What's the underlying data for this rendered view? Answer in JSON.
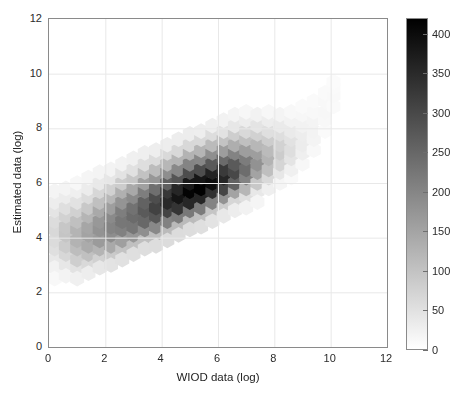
{
  "chart_data": {
    "type": "heatmap",
    "subtype": "hexbin",
    "title": "",
    "xlabel": "WIOD data (log)",
    "ylabel": "Estimated data (log)",
    "xlim": [
      0,
      12
    ],
    "ylim": [
      0,
      12
    ],
    "xticks": [
      0,
      2,
      4,
      6,
      8,
      10,
      12
    ],
    "yticks": [
      0,
      2,
      4,
      6,
      8,
      10,
      12
    ],
    "xtick_labels": [
      "0",
      "2",
      "4",
      "6",
      "8",
      "10",
      "12"
    ],
    "ytick_labels": [
      "0",
      "2",
      "4",
      "6",
      "8",
      "10",
      "12"
    ],
    "grid": true,
    "colormap": "grayscale-inverted",
    "colorbar": {
      "position": "right",
      "vmin": 0,
      "vmax": 420,
      "ticks": [
        0,
        50,
        100,
        150,
        200,
        250,
        300,
        350,
        400
      ],
      "tick_labels": [
        "0",
        "50",
        "100",
        "150",
        "200",
        "250",
        "300",
        "350",
        "400"
      ]
    },
    "hex_grid": {
      "radius_data_units": 0.2356,
      "dx_data_units": 0.408,
      "dy_data_units": 0.3534,
      "note": "Hexagonal bins tiled across the x-y plane; counts mapped to grayscale via colorbar."
    },
    "bins": [
      {
        "x": 0.2,
        "y": 3.2,
        "c": 38
      },
      {
        "x": 0.2,
        "y": 3.6,
        "c": 52
      },
      {
        "x": 0.2,
        "y": 3.9,
        "c": 60
      },
      {
        "x": 0.2,
        "y": 4.3,
        "c": 64
      },
      {
        "x": 0.2,
        "y": 4.6,
        "c": 58
      },
      {
        "x": 0.2,
        "y": 5.0,
        "c": 44
      },
      {
        "x": 0.2,
        "y": 5.3,
        "c": 30
      },
      {
        "x": 0.2,
        "y": 5.7,
        "c": 18
      },
      {
        "x": 0.2,
        "y": 2.9,
        "c": 22
      },
      {
        "x": 0.2,
        "y": 2.5,
        "c": 12
      },
      {
        "x": 0.6,
        "y": 3.0,
        "c": 40
      },
      {
        "x": 0.6,
        "y": 3.4,
        "c": 66
      },
      {
        "x": 0.6,
        "y": 3.7,
        "c": 84
      },
      {
        "x": 0.6,
        "y": 4.1,
        "c": 96
      },
      {
        "x": 0.6,
        "y": 4.4,
        "c": 92
      },
      {
        "x": 0.6,
        "y": 4.8,
        "c": 74
      },
      {
        "x": 0.6,
        "y": 5.1,
        "c": 52
      },
      {
        "x": 0.6,
        "y": 5.5,
        "c": 32
      },
      {
        "x": 0.6,
        "y": 5.8,
        "c": 18
      },
      {
        "x": 0.6,
        "y": 2.6,
        "c": 20
      },
      {
        "x": 1.0,
        "y": 2.9,
        "c": 48
      },
      {
        "x": 1.0,
        "y": 3.2,
        "c": 80
      },
      {
        "x": 1.0,
        "y": 3.6,
        "c": 108
      },
      {
        "x": 1.0,
        "y": 3.9,
        "c": 126
      },
      {
        "x": 1.0,
        "y": 4.3,
        "c": 124
      },
      {
        "x": 1.0,
        "y": 4.6,
        "c": 104
      },
      {
        "x": 1.0,
        "y": 5.0,
        "c": 76
      },
      {
        "x": 1.0,
        "y": 5.3,
        "c": 48
      },
      {
        "x": 1.0,
        "y": 5.7,
        "c": 26
      },
      {
        "x": 1.0,
        "y": 6.0,
        "c": 14
      },
      {
        "x": 1.0,
        "y": 2.5,
        "c": 24
      },
      {
        "x": 1.4,
        "y": 3.0,
        "c": 62
      },
      {
        "x": 1.4,
        "y": 3.4,
        "c": 104
      },
      {
        "x": 1.4,
        "y": 3.7,
        "c": 138
      },
      {
        "x": 1.4,
        "y": 4.1,
        "c": 152
      },
      {
        "x": 1.4,
        "y": 4.4,
        "c": 146
      },
      {
        "x": 1.4,
        "y": 4.8,
        "c": 122
      },
      {
        "x": 1.4,
        "y": 5.1,
        "c": 90
      },
      {
        "x": 1.4,
        "y": 5.5,
        "c": 58
      },
      {
        "x": 1.4,
        "y": 5.8,
        "c": 32
      },
      {
        "x": 1.4,
        "y": 6.2,
        "c": 16
      },
      {
        "x": 1.4,
        "y": 2.7,
        "c": 30
      },
      {
        "x": 1.8,
        "y": 3.2,
        "c": 76
      },
      {
        "x": 1.8,
        "y": 3.6,
        "c": 124
      },
      {
        "x": 1.8,
        "y": 3.9,
        "c": 164
      },
      {
        "x": 1.8,
        "y": 4.3,
        "c": 178
      },
      {
        "x": 1.8,
        "y": 4.6,
        "c": 170
      },
      {
        "x": 1.8,
        "y": 5.0,
        "c": 142
      },
      {
        "x": 1.8,
        "y": 5.3,
        "c": 104
      },
      {
        "x": 1.8,
        "y": 5.7,
        "c": 66
      },
      {
        "x": 1.8,
        "y": 6.0,
        "c": 36
      },
      {
        "x": 1.8,
        "y": 6.4,
        "c": 18
      },
      {
        "x": 1.8,
        "y": 2.9,
        "c": 40
      },
      {
        "x": 2.2,
        "y": 3.4,
        "c": 88
      },
      {
        "x": 2.2,
        "y": 3.7,
        "c": 142
      },
      {
        "x": 2.2,
        "y": 4.1,
        "c": 188
      },
      {
        "x": 2.2,
        "y": 4.4,
        "c": 202
      },
      {
        "x": 2.2,
        "y": 4.8,
        "c": 192
      },
      {
        "x": 2.2,
        "y": 5.1,
        "c": 160
      },
      {
        "x": 2.2,
        "y": 5.5,
        "c": 118
      },
      {
        "x": 2.2,
        "y": 5.8,
        "c": 76
      },
      {
        "x": 2.2,
        "y": 6.2,
        "c": 42
      },
      {
        "x": 2.2,
        "y": 6.5,
        "c": 20
      },
      {
        "x": 2.2,
        "y": 3.0,
        "c": 46
      },
      {
        "x": 2.6,
        "y": 3.6,
        "c": 98
      },
      {
        "x": 2.6,
        "y": 3.9,
        "c": 158
      },
      {
        "x": 2.6,
        "y": 4.3,
        "c": 208
      },
      {
        "x": 2.6,
        "y": 4.6,
        "c": 224
      },
      {
        "x": 2.6,
        "y": 5.0,
        "c": 212
      },
      {
        "x": 2.6,
        "y": 5.3,
        "c": 176
      },
      {
        "x": 2.6,
        "y": 5.7,
        "c": 130
      },
      {
        "x": 2.6,
        "y": 6.0,
        "c": 84
      },
      {
        "x": 2.6,
        "y": 6.4,
        "c": 46
      },
      {
        "x": 2.6,
        "y": 6.7,
        "c": 22
      },
      {
        "x": 2.6,
        "y": 3.2,
        "c": 50
      },
      {
        "x": 3.0,
        "y": 3.7,
        "c": 104
      },
      {
        "x": 3.0,
        "y": 4.1,
        "c": 172
      },
      {
        "x": 3.0,
        "y": 4.4,
        "c": 226
      },
      {
        "x": 3.0,
        "y": 4.8,
        "c": 244
      },
      {
        "x": 3.0,
        "y": 5.1,
        "c": 232
      },
      {
        "x": 3.0,
        "y": 5.5,
        "c": 192
      },
      {
        "x": 3.0,
        "y": 5.8,
        "c": 142
      },
      {
        "x": 3.0,
        "y": 6.2,
        "c": 92
      },
      {
        "x": 3.0,
        "y": 6.5,
        "c": 50
      },
      {
        "x": 3.0,
        "y": 6.9,
        "c": 24
      },
      {
        "x": 3.0,
        "y": 3.4,
        "c": 52
      },
      {
        "x": 3.4,
        "y": 3.9,
        "c": 106
      },
      {
        "x": 3.4,
        "y": 4.3,
        "c": 184
      },
      {
        "x": 3.4,
        "y": 4.6,
        "c": 248
      },
      {
        "x": 3.4,
        "y": 5.0,
        "c": 272
      },
      {
        "x": 3.4,
        "y": 5.3,
        "c": 258
      },
      {
        "x": 3.4,
        "y": 5.7,
        "c": 212
      },
      {
        "x": 3.4,
        "y": 6.0,
        "c": 156
      },
      {
        "x": 3.4,
        "y": 6.4,
        "c": 100
      },
      {
        "x": 3.4,
        "y": 6.7,
        "c": 54
      },
      {
        "x": 3.4,
        "y": 7.1,
        "c": 26
      },
      {
        "x": 3.4,
        "y": 3.6,
        "c": 54
      },
      {
        "x": 3.8,
        "y": 4.1,
        "c": 108
      },
      {
        "x": 3.8,
        "y": 4.4,
        "c": 196
      },
      {
        "x": 3.8,
        "y": 4.8,
        "c": 278
      },
      {
        "x": 3.8,
        "y": 5.1,
        "c": 312
      },
      {
        "x": 3.8,
        "y": 5.5,
        "c": 294
      },
      {
        "x": 3.8,
        "y": 5.8,
        "c": 238
      },
      {
        "x": 3.8,
        "y": 6.2,
        "c": 172
      },
      {
        "x": 3.8,
        "y": 6.5,
        "c": 110
      },
      {
        "x": 3.8,
        "y": 6.9,
        "c": 58
      },
      {
        "x": 3.8,
        "y": 7.2,
        "c": 28
      },
      {
        "x": 3.8,
        "y": 3.7,
        "c": 56
      },
      {
        "x": 4.2,
        "y": 4.3,
        "c": 112
      },
      {
        "x": 4.2,
        "y": 4.6,
        "c": 206
      },
      {
        "x": 4.2,
        "y": 5.0,
        "c": 308
      },
      {
        "x": 4.2,
        "y": 5.3,
        "c": 352
      },
      {
        "x": 4.2,
        "y": 5.7,
        "c": 330
      },
      {
        "x": 4.2,
        "y": 6.0,
        "c": 262
      },
      {
        "x": 4.2,
        "y": 6.4,
        "c": 186
      },
      {
        "x": 4.2,
        "y": 6.7,
        "c": 118
      },
      {
        "x": 4.2,
        "y": 7.1,
        "c": 62
      },
      {
        "x": 4.2,
        "y": 7.4,
        "c": 30
      },
      {
        "x": 4.2,
        "y": 3.9,
        "c": 58
      },
      {
        "x": 4.6,
        "y": 4.4,
        "c": 114
      },
      {
        "x": 4.6,
        "y": 4.8,
        "c": 216
      },
      {
        "x": 4.6,
        "y": 5.1,
        "c": 334
      },
      {
        "x": 4.6,
        "y": 5.5,
        "c": 386
      },
      {
        "x": 4.6,
        "y": 5.8,
        "c": 358
      },
      {
        "x": 4.6,
        "y": 6.2,
        "c": 280
      },
      {
        "x": 4.6,
        "y": 6.5,
        "c": 196
      },
      {
        "x": 4.6,
        "y": 6.9,
        "c": 124
      },
      {
        "x": 4.6,
        "y": 7.2,
        "c": 64
      },
      {
        "x": 4.6,
        "y": 7.6,
        "c": 30
      },
      {
        "x": 4.6,
        "y": 4.1,
        "c": 58
      },
      {
        "x": 5.0,
        "y": 4.6,
        "c": 112
      },
      {
        "x": 5.0,
        "y": 5.0,
        "c": 222
      },
      {
        "x": 5.0,
        "y": 5.3,
        "c": 356
      },
      {
        "x": 5.0,
        "y": 5.7,
        "c": 414
      },
      {
        "x": 5.0,
        "y": 6.0,
        "c": 380
      },
      {
        "x": 5.0,
        "y": 6.4,
        "c": 294
      },
      {
        "x": 5.0,
        "y": 6.7,
        "c": 202
      },
      {
        "x": 5.0,
        "y": 7.1,
        "c": 126
      },
      {
        "x": 5.0,
        "y": 7.4,
        "c": 64
      },
      {
        "x": 5.0,
        "y": 7.8,
        "c": 30
      },
      {
        "x": 5.0,
        "y": 4.3,
        "c": 56
      },
      {
        "x": 5.4,
        "y": 4.8,
        "c": 106
      },
      {
        "x": 5.4,
        "y": 5.1,
        "c": 218
      },
      {
        "x": 5.4,
        "y": 5.5,
        "c": 358
      },
      {
        "x": 5.4,
        "y": 5.8,
        "c": 418
      },
      {
        "x": 5.4,
        "y": 6.2,
        "c": 382
      },
      {
        "x": 5.4,
        "y": 6.5,
        "c": 292
      },
      {
        "x": 5.4,
        "y": 6.9,
        "c": 198
      },
      {
        "x": 5.4,
        "y": 7.2,
        "c": 122
      },
      {
        "x": 5.4,
        "y": 7.6,
        "c": 62
      },
      {
        "x": 5.4,
        "y": 7.9,
        "c": 28
      },
      {
        "x": 5.4,
        "y": 4.4,
        "c": 52
      },
      {
        "x": 5.8,
        "y": 5.0,
        "c": 96
      },
      {
        "x": 5.8,
        "y": 5.3,
        "c": 204
      },
      {
        "x": 5.8,
        "y": 5.7,
        "c": 340
      },
      {
        "x": 5.8,
        "y": 6.0,
        "c": 398
      },
      {
        "x": 5.8,
        "y": 6.4,
        "c": 362
      },
      {
        "x": 5.8,
        "y": 6.7,
        "c": 274
      },
      {
        "x": 5.8,
        "y": 7.1,
        "c": 184
      },
      {
        "x": 5.8,
        "y": 7.4,
        "c": 112
      },
      {
        "x": 5.8,
        "y": 7.8,
        "c": 56
      },
      {
        "x": 5.8,
        "y": 8.1,
        "c": 26
      },
      {
        "x": 5.8,
        "y": 4.6,
        "c": 46
      },
      {
        "x": 6.2,
        "y": 5.1,
        "c": 84
      },
      {
        "x": 6.2,
        "y": 5.5,
        "c": 180
      },
      {
        "x": 6.2,
        "y": 5.8,
        "c": 306
      },
      {
        "x": 6.2,
        "y": 6.2,
        "c": 358
      },
      {
        "x": 6.2,
        "y": 6.5,
        "c": 324
      },
      {
        "x": 6.2,
        "y": 6.9,
        "c": 244
      },
      {
        "x": 6.2,
        "y": 7.2,
        "c": 162
      },
      {
        "x": 6.2,
        "y": 7.6,
        "c": 98
      },
      {
        "x": 6.2,
        "y": 7.9,
        "c": 48
      },
      {
        "x": 6.2,
        "y": 8.3,
        "c": 22
      },
      {
        "x": 6.2,
        "y": 4.8,
        "c": 38
      },
      {
        "x": 6.6,
        "y": 5.3,
        "c": 68
      },
      {
        "x": 6.6,
        "y": 5.7,
        "c": 152
      },
      {
        "x": 6.6,
        "y": 6.0,
        "c": 258
      },
      {
        "x": 6.6,
        "y": 6.4,
        "c": 302
      },
      {
        "x": 6.6,
        "y": 6.7,
        "c": 272
      },
      {
        "x": 6.6,
        "y": 7.1,
        "c": 204
      },
      {
        "x": 6.6,
        "y": 7.4,
        "c": 134
      },
      {
        "x": 6.6,
        "y": 7.8,
        "c": 80
      },
      {
        "x": 6.6,
        "y": 8.1,
        "c": 40
      },
      {
        "x": 6.6,
        "y": 8.5,
        "c": 18
      },
      {
        "x": 6.6,
        "y": 5.0,
        "c": 30
      },
      {
        "x": 7.0,
        "y": 5.5,
        "c": 52
      },
      {
        "x": 7.0,
        "y": 5.8,
        "c": 120
      },
      {
        "x": 7.0,
        "y": 6.2,
        "c": 204
      },
      {
        "x": 7.0,
        "y": 6.5,
        "c": 240
      },
      {
        "x": 7.0,
        "y": 6.9,
        "c": 216
      },
      {
        "x": 7.0,
        "y": 7.2,
        "c": 160
      },
      {
        "x": 7.0,
        "y": 7.6,
        "c": 104
      },
      {
        "x": 7.0,
        "y": 7.9,
        "c": 62
      },
      {
        "x": 7.0,
        "y": 8.3,
        "c": 30
      },
      {
        "x": 7.0,
        "y": 8.6,
        "c": 14
      },
      {
        "x": 7.0,
        "y": 5.1,
        "c": 22
      },
      {
        "x": 7.4,
        "y": 5.7,
        "c": 38
      },
      {
        "x": 7.4,
        "y": 6.0,
        "c": 90
      },
      {
        "x": 7.4,
        "y": 6.4,
        "c": 152
      },
      {
        "x": 7.4,
        "y": 6.7,
        "c": 180
      },
      {
        "x": 7.4,
        "y": 7.1,
        "c": 160
      },
      {
        "x": 7.4,
        "y": 7.4,
        "c": 118
      },
      {
        "x": 7.4,
        "y": 7.8,
        "c": 76
      },
      {
        "x": 7.4,
        "y": 8.1,
        "c": 44
      },
      {
        "x": 7.4,
        "y": 8.5,
        "c": 22
      },
      {
        "x": 7.4,
        "y": 5.3,
        "c": 16
      },
      {
        "x": 7.8,
        "y": 5.8,
        "c": 26
      },
      {
        "x": 7.8,
        "y": 6.2,
        "c": 62
      },
      {
        "x": 7.8,
        "y": 6.5,
        "c": 106
      },
      {
        "x": 7.8,
        "y": 6.9,
        "c": 126
      },
      {
        "x": 7.8,
        "y": 7.2,
        "c": 112
      },
      {
        "x": 7.8,
        "y": 7.6,
        "c": 82
      },
      {
        "x": 7.8,
        "y": 7.9,
        "c": 52
      },
      {
        "x": 7.8,
        "y": 8.3,
        "c": 30
      },
      {
        "x": 7.8,
        "y": 8.6,
        "c": 14
      },
      {
        "x": 8.2,
        "y": 6.0,
        "c": 16
      },
      {
        "x": 8.2,
        "y": 6.4,
        "c": 40
      },
      {
        "x": 8.2,
        "y": 6.7,
        "c": 70
      },
      {
        "x": 8.2,
        "y": 7.1,
        "c": 84
      },
      {
        "x": 8.2,
        "y": 7.4,
        "c": 74
      },
      {
        "x": 8.2,
        "y": 7.8,
        "c": 54
      },
      {
        "x": 8.2,
        "y": 8.1,
        "c": 34
      },
      {
        "x": 8.2,
        "y": 8.5,
        "c": 18
      },
      {
        "x": 8.6,
        "y": 6.2,
        "c": 10
      },
      {
        "x": 8.6,
        "y": 6.5,
        "c": 24
      },
      {
        "x": 8.6,
        "y": 6.9,
        "c": 44
      },
      {
        "x": 8.6,
        "y": 7.2,
        "c": 54
      },
      {
        "x": 8.6,
        "y": 7.6,
        "c": 48
      },
      {
        "x": 8.6,
        "y": 7.9,
        "c": 34
      },
      {
        "x": 8.6,
        "y": 8.3,
        "c": 22
      },
      {
        "x": 8.6,
        "y": 8.6,
        "c": 12
      },
      {
        "x": 9.0,
        "y": 6.7,
        "c": 14
      },
      {
        "x": 9.0,
        "y": 7.1,
        "c": 26
      },
      {
        "x": 9.0,
        "y": 7.4,
        "c": 32
      },
      {
        "x": 9.0,
        "y": 7.8,
        "c": 30
      },
      {
        "x": 9.0,
        "y": 8.1,
        "c": 22
      },
      {
        "x": 9.0,
        "y": 8.5,
        "c": 14
      },
      {
        "x": 9.0,
        "y": 8.8,
        "c": 8
      },
      {
        "x": 9.4,
        "y": 7.2,
        "c": 12
      },
      {
        "x": 9.4,
        "y": 7.6,
        "c": 18
      },
      {
        "x": 9.4,
        "y": 7.9,
        "c": 20
      },
      {
        "x": 9.4,
        "y": 8.3,
        "c": 18
      },
      {
        "x": 9.4,
        "y": 8.6,
        "c": 12
      },
      {
        "x": 9.4,
        "y": 9.0,
        "c": 8
      },
      {
        "x": 9.8,
        "y": 7.9,
        "c": 8
      },
      {
        "x": 9.8,
        "y": 8.3,
        "c": 12
      },
      {
        "x": 9.8,
        "y": 8.6,
        "c": 14
      },
      {
        "x": 9.8,
        "y": 9.0,
        "c": 12
      },
      {
        "x": 9.8,
        "y": 9.3,
        "c": 8
      },
      {
        "x": 10.1,
        "y": 8.8,
        "c": 8
      },
      {
        "x": 10.1,
        "y": 9.2,
        "c": 10
      },
      {
        "x": 10.1,
        "y": 9.5,
        "c": 8
      },
      {
        "x": 10.1,
        "y": 9.7,
        "c": 6
      }
    ]
  },
  "axes": {
    "xlabel": "WIOD data (log)",
    "ylabel": "Estimated data (log)",
    "xticks": [
      "0",
      "2",
      "4",
      "6",
      "8",
      "10",
      "12"
    ],
    "yticks": [
      "0",
      "2",
      "4",
      "6",
      "8",
      "10",
      "12"
    ]
  },
  "colorbar": {
    "ticks": [
      "0",
      "50",
      "100",
      "150",
      "200",
      "250",
      "300",
      "350",
      "400"
    ]
  },
  "colors": {
    "axis_line": "#8a8a8a",
    "grid": "#e8e8e8",
    "text": "#2b2b2b",
    "background": "#ffffff",
    "cmap_low": "#ffffff",
    "cmap_high": "#000000"
  }
}
